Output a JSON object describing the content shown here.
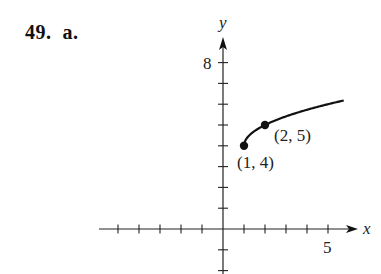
{
  "problem": {
    "number": "49.",
    "part": "a."
  },
  "chart_data": {
    "type": "line",
    "title": "",
    "xlabel": "x",
    "ylabel": "y",
    "function": "y = sqrt(x - 1) + 4",
    "domain": [
      1,
      5.75
    ],
    "x": [
      1,
      1.25,
      1.5,
      2,
      2.5,
      3,
      3.5,
      4,
      4.5,
      5,
      5.5,
      5.75
    ],
    "y": [
      4,
      4.5,
      4.71,
      5,
      5.22,
      5.41,
      5.58,
      5.73,
      5.87,
      6,
      6.12,
      6.18
    ],
    "points": [
      {
        "x": 1,
        "y": 4,
        "label": "(1, 4)"
      },
      {
        "x": 2,
        "y": 5,
        "label": "(2, 5)"
      }
    ],
    "xlim": [
      -6,
      6
    ],
    "ylim": [
      -2,
      9
    ],
    "x_tick_labels": [
      {
        "value": 5,
        "label": "5"
      }
    ],
    "y_tick_labels": [
      {
        "value": 8,
        "label": "8"
      }
    ],
    "x_ticks": [
      -5,
      -4,
      -3,
      -2,
      -1,
      1,
      2,
      3,
      4,
      5
    ],
    "y_ticks": [
      -2,
      -1,
      1,
      2,
      3,
      4,
      5,
      6,
      7,
      8
    ],
    "grid": false,
    "colors": {
      "ink": "#111111"
    }
  }
}
